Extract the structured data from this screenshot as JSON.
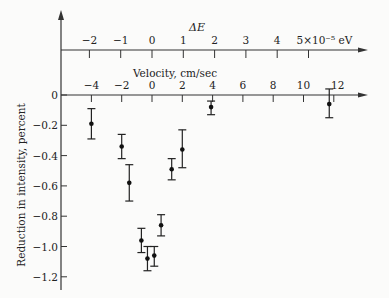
{
  "chart_data": {
    "type": "scatter",
    "title": "",
    "top_axis": {
      "label": "ΔE",
      "ticks": [
        -2,
        -1,
        0,
        1,
        2,
        3,
        4,
        5
      ],
      "tick_labels": [
        "−2",
        "−1",
        "0",
        "1",
        "2",
        "3",
        "4",
        "5×10⁻⁵ eV"
      ],
      "unit": "eV (×10⁻⁵)"
    },
    "xlabel": "Velocity, cm/sec",
    "xticks": [
      -4,
      -2,
      0,
      2,
      4,
      6,
      8,
      10,
      12
    ],
    "xtick_labels": [
      "−4",
      "−2",
      "0",
      "2",
      "4",
      "6",
      "8",
      "10",
      "12"
    ],
    "ylabel": "Reduction in intensity, percent",
    "yticks": [
      0,
      -0.2,
      -0.4,
      -0.6,
      -0.8,
      -1.0,
      -1.2
    ],
    "ytick_labels": [
      "0",
      "−0.2",
      "−0.4",
      "−0.6",
      "−0.8",
      "−1.0",
      "−1.2"
    ],
    "xlim": [
      -6,
      14
    ],
    "ylim": [
      -1.27,
      0
    ],
    "grid": false,
    "series": [
      {
        "name": "measurements",
        "points": [
          {
            "x": -4.0,
            "y": -0.19,
            "err_low": -0.29,
            "err_high": -0.09
          },
          {
            "x": -2.0,
            "y": -0.34,
            "err_low": -0.42,
            "err_high": -0.26
          },
          {
            "x": -1.5,
            "y": -0.58,
            "err_low": -0.7,
            "err_high": -0.46
          },
          {
            "x": -0.7,
            "y": -0.96,
            "err_low": -1.04,
            "err_high": -0.88
          },
          {
            "x": -0.3,
            "y": -1.08,
            "err_low": -1.16,
            "err_high": -1.0
          },
          {
            "x": 0.15,
            "y": -1.06,
            "err_low": -1.13,
            "err_high": -1.0
          },
          {
            "x": 0.6,
            "y": -0.86,
            "err_low": -0.93,
            "err_high": -0.79
          },
          {
            "x": 1.3,
            "y": -0.49,
            "err_low": -0.56,
            "err_high": -0.42
          },
          {
            "x": 2.0,
            "y": -0.36,
            "err_low": -0.48,
            "err_high": -0.23
          },
          {
            "x": 3.9,
            "y": -0.08,
            "err_low": -0.13,
            "err_high": -0.04
          },
          {
            "x": 11.7,
            "y": -0.06,
            "err_low": -0.15,
            "err_high": 0.04
          }
        ]
      }
    ]
  }
}
